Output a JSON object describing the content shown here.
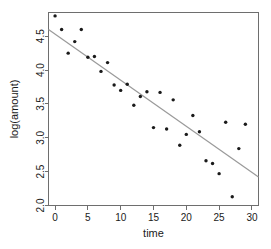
{
  "chart_data": {
    "type": "scatter",
    "title": "",
    "xlabel": "time",
    "ylabel": "log(amount)",
    "xlim": [
      -1.0,
      31.0
    ],
    "ylim": [
      2.0,
      4.85
    ],
    "grid": false,
    "legend": "none",
    "xticks": [
      0,
      5,
      10,
      15,
      20,
      25,
      30
    ],
    "xtick_labels": [
      "0",
      "5",
      "10",
      "15",
      "20",
      "25",
      "30"
    ],
    "yticks": [
      2.0,
      2.5,
      3.0,
      3.5,
      4.0,
      4.5
    ],
    "ytick_labels": [
      "2.0",
      "2.5",
      "3.0",
      "3.5",
      "4.0",
      "4.5"
    ],
    "point_color": "#1a1a1a",
    "line_color": "#9a9a9a",
    "axis_color": "#6e6e6e",
    "background": "#ffffff",
    "series": [
      {
        "name": "observations",
        "marker": "dot",
        "x": [
          0,
          1,
          2,
          3,
          4,
          5,
          6,
          7,
          8,
          9,
          10,
          11,
          12,
          13,
          14,
          15,
          16,
          17,
          18,
          19,
          20,
          21,
          22,
          23,
          24,
          25,
          26,
          27,
          28,
          29
        ],
        "y": [
          4.8,
          4.6,
          4.25,
          4.42,
          4.6,
          4.19,
          4.2,
          3.98,
          4.11,
          3.78,
          3.7,
          3.79,
          3.48,
          3.61,
          3.68,
          3.15,
          3.67,
          3.13,
          3.56,
          2.89,
          3.05,
          3.33,
          3.09,
          2.66,
          2.62,
          2.47,
          3.23,
          2.13,
          2.84,
          3.2
        ]
      }
    ],
    "fit_line": {
      "name": "least-squares fit",
      "x": [
        -1.0,
        31.0
      ],
      "y": [
        4.6,
        2.42
      ],
      "slope": -0.0681,
      "intercept": 4.532
    }
  }
}
